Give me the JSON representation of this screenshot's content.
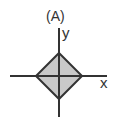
{
  "figure": {
    "panel_label": "(A)",
    "axes": {
      "x_label": "x",
      "y_label": "y"
    },
    "shape": {
      "type": "diamond",
      "fill": "#c9c9c9",
      "stroke": "#333333"
    }
  }
}
